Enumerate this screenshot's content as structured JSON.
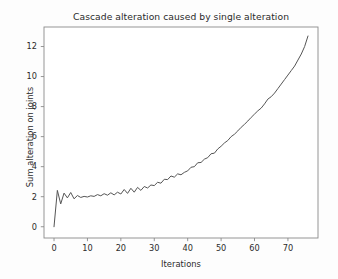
{
  "figure": {
    "background_color": "#fdfdfd",
    "plot_background_color": "#ffffff",
    "axes_color": "#8a8a8a",
    "line_color": "#555555"
  },
  "chart_data": {
    "type": "line",
    "title": "Cascade alteration caused by single alteration",
    "xlabel": "Iterations",
    "ylabel": "Sum alteration on joints",
    "grid": false,
    "legend": null,
    "xlim": [
      -3.0,
      79.0
    ],
    "ylim": [
      -0.75,
      13.3
    ],
    "xticks": [
      0,
      10,
      20,
      30,
      40,
      50,
      60,
      70
    ],
    "xtick_labels": [
      "0",
      "10",
      "20",
      "30",
      "40",
      "50",
      "60",
      "70"
    ],
    "yticks": [
      0,
      2,
      4,
      6,
      8,
      10,
      12
    ],
    "ytick_labels": [
      "0",
      "2",
      "4",
      "6",
      "8",
      "10",
      "12"
    ],
    "series": [
      {
        "name": "sum alteration",
        "x": [
          0,
          1,
          2,
          3,
          4,
          5,
          6,
          7,
          8,
          9,
          10,
          11,
          12,
          13,
          14,
          15,
          16,
          17,
          18,
          19,
          20,
          21,
          22,
          23,
          24,
          25,
          26,
          27,
          28,
          29,
          30,
          31,
          32,
          33,
          34,
          35,
          36,
          37,
          38,
          39,
          40,
          41,
          42,
          43,
          44,
          45,
          46,
          47,
          48,
          49,
          50,
          51,
          52,
          53,
          54,
          55,
          56,
          57,
          58,
          59,
          60,
          61,
          62,
          63,
          64,
          65,
          66,
          67,
          68,
          69,
          70,
          71,
          72,
          73,
          74,
          75,
          76
        ],
        "y": [
          0.0,
          2.42,
          1.52,
          2.24,
          1.92,
          2.28,
          1.86,
          2.08,
          1.95,
          2.02,
          1.98,
          2.06,
          2.02,
          2.14,
          2.06,
          2.2,
          2.1,
          2.26,
          2.12,
          2.3,
          2.18,
          2.48,
          2.22,
          2.56,
          2.3,
          2.62,
          2.42,
          2.68,
          2.58,
          2.78,
          2.74,
          2.96,
          2.9,
          3.16,
          3.14,
          3.38,
          3.3,
          3.52,
          3.46,
          3.62,
          3.72,
          3.96,
          4.0,
          4.26,
          4.28,
          4.5,
          4.6,
          4.86,
          4.9,
          5.18,
          5.36,
          5.58,
          5.74,
          6.0,
          6.16,
          6.38,
          6.62,
          6.82,
          7.04,
          7.28,
          7.5,
          7.72,
          7.9,
          8.18,
          8.5,
          8.66,
          8.9,
          9.2,
          9.5,
          9.8,
          10.1,
          10.4,
          10.7,
          11.1,
          11.5,
          12.0,
          12.7
        ]
      }
    ]
  }
}
